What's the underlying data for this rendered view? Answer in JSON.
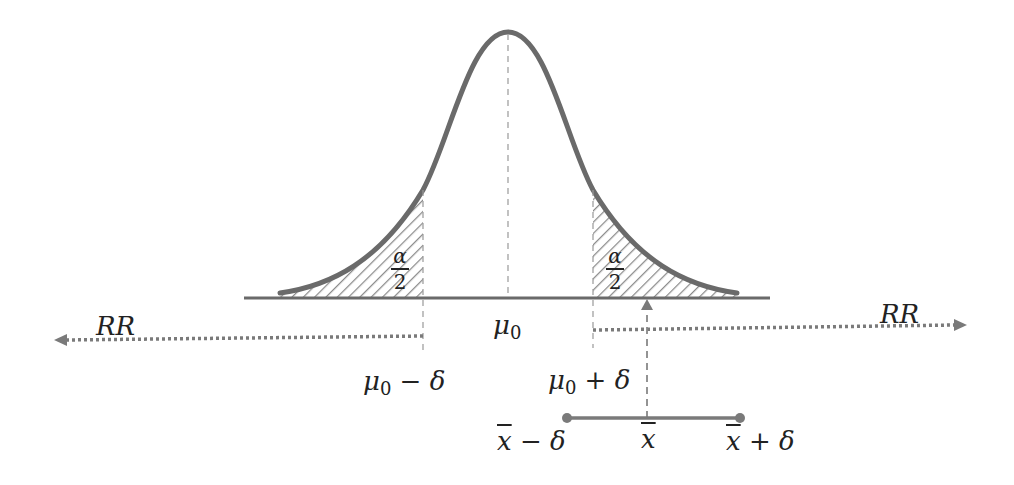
{
  "diagram": {
    "colors": {
      "curve": "#6a6a6a",
      "baseline": "#6a6a6a",
      "hatch": "#8a8a8a",
      "arrow": "#7a7a7a",
      "text": "#222222"
    },
    "labels": {
      "rr_left": "RR",
      "rr_right": "RR",
      "mu0": "μ",
      "mu0_sub": "0",
      "mu0_minus_delta": "μ",
      "mu0_minus_delta_sub": "0",
      "mu0_minus_delta_tail": " − δ",
      "mu0_plus_delta": "μ",
      "mu0_plus_delta_sub": "0",
      "mu0_plus_delta_tail": " + δ",
      "alpha_num_left": "α",
      "alpha_den_left": "2",
      "alpha_num_right": "α",
      "alpha_den_right": "2",
      "xbar_minus_delta_x": "x",
      "xbar_minus_delta_tail": " − δ",
      "xbar": "x",
      "xbar_plus_delta_x": "x",
      "xbar_plus_delta_tail": " + δ"
    },
    "geometry": {
      "baseline": {
        "x1": 244,
        "x2": 770,
        "y": 298
      },
      "peak": {
        "x": 508,
        "y": 32
      },
      "critical_left_x": 423,
      "critical_right_x": 593,
      "rr_left_arrow": {
        "x1": 423,
        "x2": 55,
        "y": 340
      },
      "rr_right_arrow": {
        "x1": 593,
        "x2": 966,
        "y": 328
      },
      "xbar_arrow": {
        "x": 647,
        "y1": 418,
        "y2": 298
      },
      "ci_segment": {
        "x1": 567,
        "x2": 740,
        "y": 418
      }
    }
  }
}
